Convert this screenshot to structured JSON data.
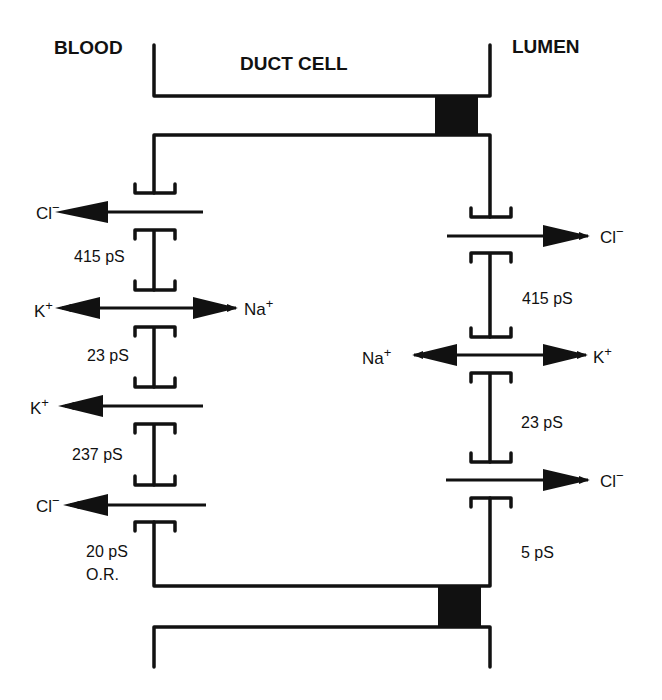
{
  "labels": {
    "blood": "BLOOD",
    "duct_cell": "DUCT CELL",
    "lumen": "LUMEN"
  },
  "basolateral_channels": [
    {
      "ion": "Cl",
      "charge": "−",
      "direction": "to-blood",
      "conductance": "415 pS"
    },
    {
      "ion_left": "K",
      "charge_left": "+",
      "ion_right": "Na",
      "charge_right": "+",
      "direction": "bidirectional",
      "conductance": "23 pS"
    },
    {
      "ion": "K",
      "charge": "+",
      "direction": "to-blood",
      "conductance": "237 pS"
    },
    {
      "ion": "Cl",
      "charge": "−",
      "direction": "to-blood",
      "conductance": "20 pS",
      "note": "O.R."
    }
  ],
  "apical_channels": [
    {
      "ion": "Cl",
      "charge": "−",
      "direction": "to-lumen",
      "conductance": "415 pS"
    },
    {
      "ion_left": "Na",
      "charge_left": "+",
      "ion_right": "K",
      "charge_right": "+",
      "direction": "bidirectional",
      "conductance": "23 pS"
    },
    {
      "ion": "Cl",
      "charge": "−",
      "direction": "to-lumen",
      "conductance": "5 pS"
    }
  ],
  "text": {
    "l_cl1": "Cl",
    "l_cl1_sup": "−",
    "l_415": "415 pS",
    "l_k1": "K",
    "l_k1_sup": "+",
    "l_na": "Na",
    "l_na_sup": "+",
    "l_23": "23 pS",
    "l_k2": "K",
    "l_k2_sup": "+",
    "l_237": "237 pS",
    "l_cl2": "Cl",
    "l_cl2_sup": "−",
    "l_20": "20 pS",
    "l_or": "O.R.",
    "r_cl1": "Cl",
    "r_cl1_sup": "−",
    "r_415": "415 pS",
    "r_na": "Na",
    "r_na_sup": "+",
    "r_k": "K",
    "r_k_sup": "+",
    "r_23": "23 pS",
    "r_cl2": "Cl",
    "r_cl2_sup": "−",
    "r_5": "5 pS"
  },
  "colors": {
    "ink": "#111111",
    "background": "#ffffff"
  }
}
